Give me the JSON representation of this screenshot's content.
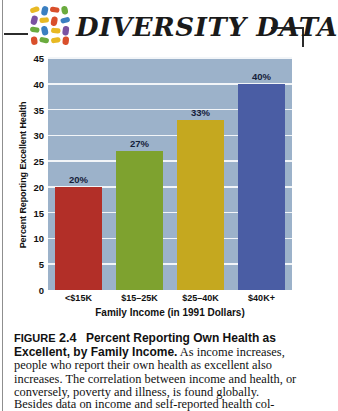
{
  "header": {
    "title": "DIVERSITY DATA",
    "logo_name": "diversity-mosaic-logo",
    "logo_tiles": [
      {
        "color": "#e8b923",
        "x": 1,
        "y": 2,
        "w": 9,
        "h": 5,
        "r": -18
      },
      {
        "color": "#3a7fc1",
        "x": 12,
        "y": 1,
        "w": 6,
        "h": 9,
        "r": 12
      },
      {
        "color": "#d94f2b",
        "x": 20,
        "y": 2,
        "w": 9,
        "h": 5,
        "r": 8
      },
      {
        "color": "#6aab3e",
        "x": 31,
        "y": 1,
        "w": 6,
        "h": 8,
        "r": -10
      },
      {
        "color": "#7a52a1",
        "x": 2,
        "y": 10,
        "w": 6,
        "h": 9,
        "r": 14
      },
      {
        "color": "#e8b923",
        "x": 10,
        "y": 12,
        "w": 9,
        "h": 5,
        "r": -6
      },
      {
        "color": "#d94f2b",
        "x": 21,
        "y": 11,
        "w": 6,
        "h": 9,
        "r": 10
      },
      {
        "color": "#3a7fc1",
        "x": 30,
        "y": 12,
        "w": 9,
        "h": 5,
        "r": -14
      },
      {
        "color": "#6aab3e",
        "x": 1,
        "y": 21,
        "w": 9,
        "h": 5,
        "r": 10
      },
      {
        "color": "#3a7fc1",
        "x": 12,
        "y": 20,
        "w": 6,
        "h": 9,
        "r": -12
      },
      {
        "color": "#e8b923",
        "x": 21,
        "y": 22,
        "w": 9,
        "h": 5,
        "r": 6
      },
      {
        "color": "#7a52a1",
        "x": 32,
        "y": 20,
        "w": 6,
        "h": 9,
        "r": 8
      },
      {
        "color": "#d94f2b",
        "x": 2,
        "y": 30,
        "w": 6,
        "h": 8,
        "r": -8
      },
      {
        "color": "#6aab3e",
        "x": 10,
        "y": 31,
        "w": 9,
        "h": 5,
        "r": 12
      },
      {
        "color": "#e8b923",
        "x": 21,
        "y": 31,
        "w": 9,
        "h": 5,
        "r": -10
      },
      {
        "color": "#d94f2b",
        "x": 32,
        "y": 30,
        "w": 6,
        "h": 8,
        "r": 6
      }
    ]
  },
  "chart_data": {
    "type": "bar",
    "title": "",
    "categories": [
      "<$15K",
      "$15–25K",
      "$25–40K",
      "$40K+"
    ],
    "values": [
      20,
      27,
      33,
      40
    ],
    "data_labels": [
      "20%",
      "27%",
      "33%",
      "40%"
    ],
    "colors": [
      "#b22f28",
      "#7ea22f",
      "#c5a81f",
      "#4a5da4"
    ],
    "xlabel": "Family Income (in 1991 Dollars)",
    "ylabel": "Percent Reporting Excellent Health",
    "ylim": [
      0,
      45
    ],
    "ytick_labels": [
      "0",
      "5",
      "10",
      "15",
      "20",
      "25",
      "30",
      "35",
      "40",
      "45"
    ],
    "ytick_values": [
      0,
      5,
      10,
      15,
      20,
      25,
      30,
      35,
      40,
      45
    ],
    "grid": true,
    "legend": "none",
    "plot_background": "#9cb2ca",
    "gridline_color": "#f2f5f8"
  },
  "caption": {
    "figure_label": "Figure",
    "figure_number": "2.4",
    "lead": "Percent Reporting Own Health as Excellent, by Family Income.",
    "body": " As income increases, people who report their own health as excellent also increases. The correlation between income and health, or conversely, poverty and illness, is found globally.",
    "clipped_line": "Besides data on income and self-reported health col-"
  }
}
